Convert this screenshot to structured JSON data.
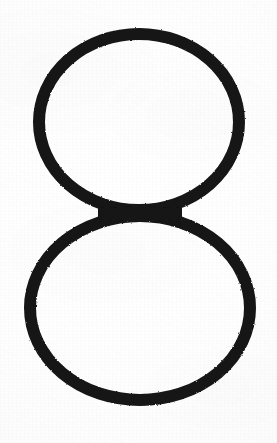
{
  "image": {
    "kind": "photograph-of-handwritten-digit",
    "subject": "numeral-eight",
    "glyph": "8",
    "description": "Hand-drawn outlined numeral eight composed of two stacked unfilled ellipses, thick black marker on white paper",
    "width": 277,
    "height": 443,
    "background_color": "#fdfdfd",
    "ink_color": "#141414",
    "paper_shadow_color": "#f4f4f4"
  },
  "strokes": {
    "style": "outline",
    "filled": false,
    "stroke_width_px": 12,
    "stroke_width_top_px": 14,
    "stroke_width_side_px": 11,
    "shapes": [
      {
        "name": "upper-loop",
        "type": "ellipse",
        "cx": 139,
        "cy": 122,
        "rx": 100,
        "ry": 88,
        "bounds": {
          "left": 33,
          "top": 28,
          "right": 246,
          "bottom": 216
        },
        "stroke_width": 12
      },
      {
        "name": "lower-loop",
        "type": "ellipse",
        "cx": 140,
        "cy": 308,
        "rx": 110,
        "ry": 92,
        "bounds": {
          "left": 24,
          "top": 210,
          "right": 257,
          "bottom": 406
        },
        "stroke_width": 12
      }
    ],
    "waist": {
      "name": "loop-junction",
      "y": 213,
      "x_center": 140,
      "note": "upper and lower loops touch and merge, forming a thickened horizontal band"
    }
  },
  "annotations": {
    "title": "",
    "caption": "",
    "labels": []
  }
}
